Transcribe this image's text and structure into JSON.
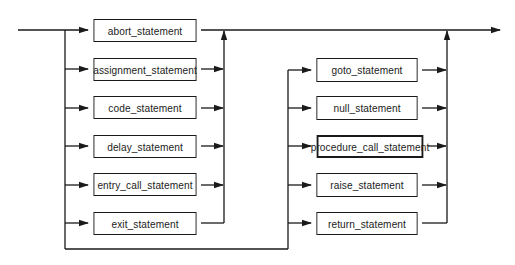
{
  "diagram": {
    "type": "syntax_diagram",
    "title": "",
    "line_color": "#1a1a1a",
    "left_group": [
      {
        "label": "abort_statement"
      },
      {
        "label": "assignment_statement"
      },
      {
        "label": "code_statement"
      },
      {
        "label": "delay_statement"
      },
      {
        "label": "entry_call_statement"
      },
      {
        "label": "exit_statement"
      }
    ],
    "right_group": [
      {
        "label": "goto_statement"
      },
      {
        "label": "null_statement"
      },
      {
        "label": "procedure_call_statement"
      },
      {
        "label": "raise_statement"
      },
      {
        "label": "return_statement"
      }
    ]
  }
}
